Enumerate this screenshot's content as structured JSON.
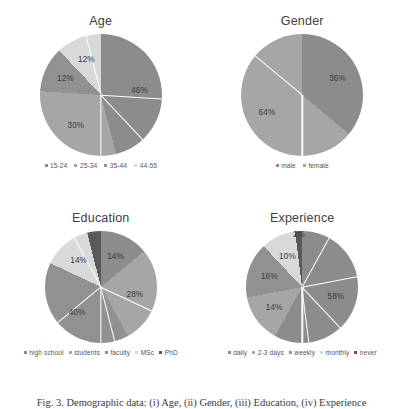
{
  "figure": {
    "caption": "Fig. 3. Demographic data: (i) Age, (ii) Gender, (iii) Education, (iv) Experience"
  },
  "palette": {
    "slice1": "#8c8c8c",
    "slice2": "#a6a6a6",
    "slice3": "#919191",
    "slice4": "#d9d9d9",
    "slice5": "#595959",
    "separator": "#ffffff",
    "text": "#3a3a3a",
    "legend_text": "#555555",
    "background": "#ffffff"
  },
  "charts": [
    {
      "id": "age",
      "title": "Age",
      "type": "pie",
      "categories": [
        "15-24",
        "25-34",
        "35-44",
        "44-55"
      ],
      "values": [
        46,
        30,
        12,
        12
      ],
      "labels": [
        "46%",
        "30%",
        "12%",
        "12%"
      ],
      "colors": [
        "#8c8c8c",
        "#a6a6a6",
        "#919191",
        "#d9d9d9"
      ]
    },
    {
      "id": "gender",
      "title": "Gender",
      "type": "pie",
      "categories": [
        "male",
        "female"
      ],
      "values": [
        36,
        64
      ],
      "labels": [
        "36%",
        "64%"
      ],
      "colors": [
        "#8c8c8c",
        "#a6a6a6"
      ]
    },
    {
      "id": "education",
      "title": "Education",
      "type": "pie",
      "categories": [
        "high school",
        "students",
        "faculty",
        "MSc",
        "PhD"
      ],
      "values": [
        14,
        28,
        40,
        14,
        4
      ],
      "labels": [
        "14%",
        "28%",
        "40%",
        "14%",
        ""
      ],
      "colors": [
        "#8c8c8c",
        "#a6a6a6",
        "#919191",
        "#d9d9d9",
        "#595959"
      ]
    },
    {
      "id": "experience",
      "title": "Experience",
      "type": "pie",
      "categories": [
        "daily",
        "2-3 days",
        "weekly",
        "monthly",
        "never"
      ],
      "values": [
        58,
        14,
        16,
        10,
        2
      ],
      "labels": [
        "58%",
        "14%",
        "16%",
        "10%",
        "2%"
      ],
      "colors": [
        "#8c8c8c",
        "#a6a6a6",
        "#919191",
        "#d9d9d9",
        "#595959"
      ]
    }
  ],
  "chart_data": [
    {
      "type": "pie",
      "title": "Age",
      "categories": [
        "15-24",
        "25-34",
        "35-44",
        "44-55"
      ],
      "values": [
        46,
        30,
        12,
        12
      ],
      "unit": "percent",
      "legend_position": "bottom",
      "data_labels": [
        "46%",
        "30%",
        "12%",
        "12%"
      ]
    },
    {
      "type": "pie",
      "title": "Gender",
      "categories": [
        "male",
        "female"
      ],
      "values": [
        64,
        36
      ],
      "unit": "percent",
      "legend_position": "bottom",
      "data_labels": [
        "64%",
        "36%"
      ]
    },
    {
      "type": "pie",
      "title": "Education",
      "categories": [
        "high school",
        "students",
        "faculty",
        "MSc",
        "PhD"
      ],
      "values": [
        14,
        28,
        40,
        14,
        4
      ],
      "unit": "percent",
      "legend_position": "bottom",
      "data_labels": [
        "14%",
        "28%",
        "40%",
        "14%",
        ""
      ]
    },
    {
      "type": "pie",
      "title": "Experience",
      "categories": [
        "daily",
        "2-3 days",
        "weekly",
        "monthly",
        "never"
      ],
      "values": [
        58,
        14,
        16,
        10,
        2
      ],
      "unit": "percent",
      "legend_position": "bottom",
      "data_labels": [
        "58%",
        "14%",
        "16%",
        "10%",
        "2%"
      ]
    }
  ]
}
